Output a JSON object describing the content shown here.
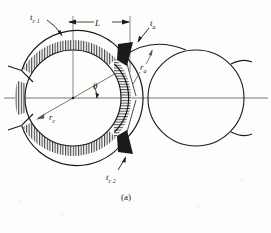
{
  "figure": {
    "caption": "(a)",
    "background_color": "#fdfdfb",
    "ink_color": "#1b1b1b",
    "labels": {
      "chip_thickness_1": {
        "base": "t",
        "sub": "c 1",
        "full": "t_c1"
      },
      "chip_thickness_2": {
        "base": "t",
        "sub": "c 2",
        "full": "t_c2"
      },
      "arc_thickness": {
        "base": "t",
        "sub": "a",
        "full": "t_a"
      },
      "cutter_radius": {
        "base": "r",
        "sub": "c",
        "full": "r_c"
      },
      "arc_radius": {
        "base": "r",
        "sub": "a",
        "full": "r_a"
      },
      "angle": {
        "base": "θ",
        "sub": "",
        "full": "theta"
      },
      "length_dimension": {
        "base": "L",
        "sub": "",
        "full": "L"
      }
    },
    "geometry": {
      "left_circle": {
        "cx": 73,
        "cy": 98,
        "r": 48,
        "name": "cutter-circle"
      },
      "right_circle": {
        "cx": 196,
        "cy": 98,
        "r": 48,
        "name": "workpiece-circle"
      },
      "annulus_outer_r": 58,
      "annulus_inner_r": 48,
      "centerline_y": 98,
      "dimension_line": {
        "x1": 68,
        "x2": 130,
        "y": 22
      },
      "theta_degrees": 30,
      "chip_hatch_direction": "horizontal",
      "annulus_hatch_direction": "vertical"
    }
  }
}
